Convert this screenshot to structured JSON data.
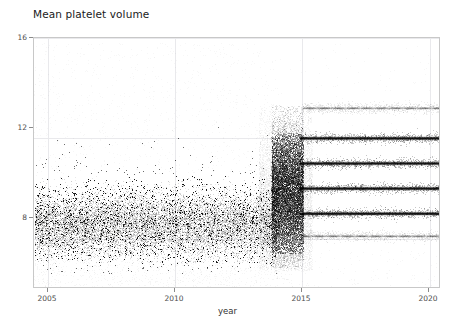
{
  "figure": {
    "title": "Mean platelet volume",
    "width": 455,
    "height": 323,
    "background": "#ffffff"
  },
  "axes": {
    "xlabel": "year",
    "ylabel": "value",
    "x_ticks": [
      "2005",
      "2010",
      "2015",
      "2020"
    ],
    "y_ticks": [
      "16",
      "12",
      "8"
    ],
    "xlim": [
      2004.45,
      2020.45
    ],
    "ylim": [
      6.0,
      16.0
    ],
    "grid": true,
    "grid_color": "#e9e9ec",
    "spine_color": "#c8c8c8",
    "tick_color": "#8a8a8a"
  },
  "chart_data": {
    "type": "scatter",
    "title": "Mean platelet volume",
    "xlabel": "year",
    "ylabel": "value",
    "xlim": [
      2004.45,
      2020.45
    ],
    "ylim": [
      6.0,
      16.0
    ],
    "x_ticks": [
      2005,
      2010,
      2015,
      2020
    ],
    "y_ticks": [
      8,
      12,
      16
    ],
    "grid": true,
    "legend": null,
    "marker_color": "#000000",
    "series": [
      {
        "name": "continuous-era-cloud",
        "x_range": [
          2004.5,
          2014.0
        ],
        "y_core_range": [
          7.0,
          10.5
        ],
        "y_full_range": [
          6.6,
          12.6
        ],
        "center": 8.6,
        "density": "very-high"
      },
      {
        "name": "transition-band",
        "x_range": [
          2013.8,
          2015.05
        ],
        "y_core_range": [
          7.4,
          12.2
        ],
        "y_full_range": [
          6.8,
          13.3
        ],
        "center": 9.8,
        "density": "extreme"
      }
    ],
    "quantised_levels": [
      {
        "value": 13.2,
        "x_start": 2015.0,
        "x_end": 2020.4,
        "intensity": "faint"
      },
      {
        "value": 12.0,
        "x_start": 2014.9,
        "x_end": 2020.4,
        "intensity": "strong"
      },
      {
        "value": 11.0,
        "x_start": 2014.9,
        "x_end": 2020.4,
        "intensity": "strong"
      },
      {
        "value": 10.0,
        "x_start": 2014.9,
        "x_end": 2020.4,
        "intensity": "strong"
      },
      {
        "value": 9.0,
        "x_start": 2014.9,
        "x_end": 2020.4,
        "intensity": "strong"
      },
      {
        "value": 8.1,
        "x_start": 2015.0,
        "x_end": 2020.4,
        "intensity": "faint"
      }
    ]
  }
}
